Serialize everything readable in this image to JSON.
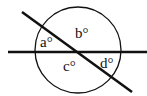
{
  "diagram": {
    "colors": {
      "stroke": "#111111",
      "background": "#ffffff"
    },
    "circle": {
      "cx": 78,
      "cy": 50,
      "r": 43
    },
    "lines": [
      {
        "name": "horizontal-line",
        "x1": 8,
        "y1": 52,
        "x2": 147,
        "y2": 52
      },
      {
        "name": "diagonal-line",
        "x1": 22,
        "y1": 12,
        "x2": 132,
        "y2": 92
      }
    ],
    "angles": [
      {
        "name": "a",
        "label": "a°",
        "x": 40,
        "y": 47
      },
      {
        "name": "b",
        "label": "b°",
        "x": 75,
        "y": 38
      },
      {
        "name": "c",
        "label": "c°",
        "x": 63,
        "y": 71
      },
      {
        "name": "d",
        "label": "d°",
        "x": 100,
        "y": 68
      }
    ]
  }
}
